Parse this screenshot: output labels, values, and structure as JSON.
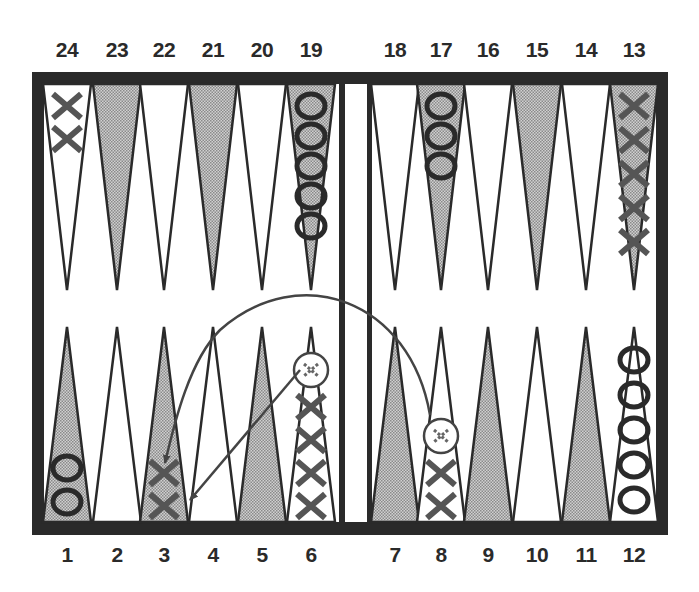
{
  "board": {
    "type": "backgammon",
    "colors": {
      "frame": "#2a2a2a",
      "shaded_point": "#b8b8b8",
      "light_point": "#ffffff",
      "checker_x": "#555555",
      "checker_o": "#2a2a2a",
      "arrow": "#444444"
    },
    "top_labels": [
      "24",
      "23",
      "22",
      "21",
      "20",
      "19",
      "18",
      "17",
      "16",
      "15",
      "14",
      "13"
    ],
    "bottom_labels": [
      "1",
      "2",
      "3",
      "4",
      "5",
      "6",
      "7",
      "8",
      "9",
      "10",
      "11",
      "12"
    ],
    "points": [
      {
        "point": 24,
        "row": "top",
        "shaded": false,
        "checker": "X",
        "count": 2
      },
      {
        "point": 23,
        "row": "top",
        "shaded": true,
        "checker": "",
        "count": 0
      },
      {
        "point": 22,
        "row": "top",
        "shaded": false,
        "checker": "",
        "count": 0
      },
      {
        "point": 21,
        "row": "top",
        "shaded": true,
        "checker": "",
        "count": 0
      },
      {
        "point": 20,
        "row": "top",
        "shaded": false,
        "checker": "",
        "count": 0
      },
      {
        "point": 19,
        "row": "top",
        "shaded": true,
        "checker": "O",
        "count": 5
      },
      {
        "point": 18,
        "row": "top",
        "shaded": false,
        "checker": "",
        "count": 0
      },
      {
        "point": 17,
        "row": "top",
        "shaded": true,
        "checker": "O",
        "count": 3
      },
      {
        "point": 16,
        "row": "top",
        "shaded": false,
        "checker": "",
        "count": 0
      },
      {
        "point": 15,
        "row": "top",
        "shaded": true,
        "checker": "",
        "count": 0
      },
      {
        "point": 14,
        "row": "top",
        "shaded": false,
        "checker": "",
        "count": 0
      },
      {
        "point": 13,
        "row": "top",
        "shaded": true,
        "checker": "X",
        "count": 5
      },
      {
        "point": 1,
        "row": "bottom",
        "shaded": true,
        "checker": "O",
        "count": 2
      },
      {
        "point": 2,
        "row": "bottom",
        "shaded": false,
        "checker": "",
        "count": 0
      },
      {
        "point": 3,
        "row": "bottom",
        "shaded": true,
        "checker": "X",
        "count": 2
      },
      {
        "point": 4,
        "row": "bottom",
        "shaded": false,
        "checker": "",
        "count": 0
      },
      {
        "point": 5,
        "row": "bottom",
        "shaded": true,
        "checker": "",
        "count": 0
      },
      {
        "point": 6,
        "row": "bottom",
        "shaded": false,
        "checker": "X",
        "count": 4,
        "ghost": true
      },
      {
        "point": 7,
        "row": "bottom",
        "shaded": true,
        "checker": "",
        "count": 0
      },
      {
        "point": 8,
        "row": "bottom",
        "shaded": false,
        "checker": "X",
        "count": 2,
        "ghost": true
      },
      {
        "point": 9,
        "row": "bottom",
        "shaded": true,
        "checker": "",
        "count": 0
      },
      {
        "point": 10,
        "row": "bottom",
        "shaded": false,
        "checker": "",
        "count": 0
      },
      {
        "point": 11,
        "row": "bottom",
        "shaded": true,
        "checker": "",
        "count": 0
      },
      {
        "point": 12,
        "row": "bottom",
        "shaded": false,
        "checker": "O",
        "count": 5
      }
    ],
    "moves": [
      {
        "from": 8,
        "to": 3
      },
      {
        "from": 6,
        "to": 3
      }
    ]
  }
}
